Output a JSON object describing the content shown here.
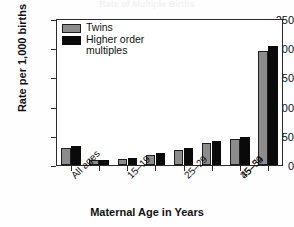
{
  "title_cut_off": "Rate of Multiple Births",
  "axes": {
    "ylabel": "Rate per 1,000 births",
    "xlabel": "Maternal Age in Years",
    "yticks": [
      "0",
      "50",
      "100",
      "150",
      "200",
      "250"
    ]
  },
  "legend": {
    "items": [
      {
        "label": "Twins",
        "color": "#8c8c8c",
        "key": "twins"
      },
      {
        "label": "Higher order multiples",
        "color": "#0a0a0a",
        "key": "hom"
      }
    ]
  },
  "chart_data": {
    "type": "bar",
    "title": "Rate of Multiple Births",
    "xlabel": "Maternal Age in Years",
    "ylabel": "Rate per 1,000 births",
    "ylim": [
      0,
      250
    ],
    "yticks": [
      0,
      50,
      100,
      150,
      200,
      250
    ],
    "grid": false,
    "legend_position": "top-left",
    "categories": [
      "All ages",
      "15-19",
      "20-24",
      "25-29",
      "30-34",
      "35-39",
      "40-44",
      "45-54"
    ],
    "tick_labels_shown": [
      "All ages",
      "",
      "15–19",
      "",
      "25–29",
      "",
      "35–39",
      "",
      "45–54"
    ],
    "series": [
      {
        "name": "Twins",
        "color": "#8c8c8c",
        "values": [
          29,
          8,
          10,
          17,
          26,
          38,
          45,
          196
        ]
      },
      {
        "name": "Higher order multiples",
        "color": "#0a0a0a",
        "values": [
          33,
          9,
          12,
          20,
          29,
          41,
          49,
          205
        ]
      }
    ]
  }
}
